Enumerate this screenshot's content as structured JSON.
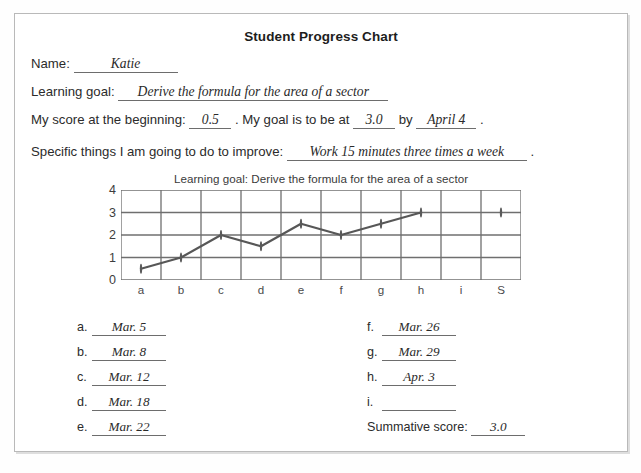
{
  "document": {
    "title": "Student Progress Chart"
  },
  "form": {
    "name_label": "Name:",
    "name_value": "Katie",
    "goal_label": "Learning goal:",
    "goal_value": "Derive the formula for the area of a sector",
    "score_label_1": "My score at the beginning:",
    "score_begin_value": "0.5",
    "score_label_2": ". My goal is to be at",
    "score_goal_value": "3.0",
    "score_label_3": "by",
    "score_date_value": "April 4",
    "score_label_4": ".",
    "specific_label": "Specific things I am going to do to improve:",
    "specific_value": "Work 15 minutes three times a week",
    "specific_suffix": "."
  },
  "chart_data": {
    "type": "line",
    "title": "Learning goal: Derive the formula for the area of a sector",
    "xlabel": "",
    "ylabel": "",
    "categories": [
      "a",
      "b",
      "c",
      "d",
      "e",
      "f",
      "g",
      "h",
      "i",
      "S"
    ],
    "values": [
      0.5,
      1.0,
      2.0,
      1.5,
      2.5,
      2.0,
      2.5,
      3.0,
      null,
      3.0
    ],
    "ylim": [
      0,
      4
    ],
    "yticks": [
      0,
      1,
      2,
      3,
      4
    ],
    "grid": true,
    "legend": "none",
    "line_color": "#575757",
    "marker_color": "#5a5a5a",
    "grid_color": "#6f6f6f",
    "series": [
      {
        "name": "Student score",
        "values": [
          0.5,
          1.0,
          2.0,
          1.5,
          2.5,
          2.0,
          2.5,
          3.0,
          null,
          3.0
        ]
      }
    ]
  },
  "dates": {
    "left": [
      {
        "label": "a.",
        "value": "Mar. 5"
      },
      {
        "label": "b.",
        "value": "Mar. 8"
      },
      {
        "label": "c.",
        "value": "Mar. 12"
      },
      {
        "label": "d.",
        "value": "Mar. 18"
      },
      {
        "label": "e.",
        "value": "Mar. 22"
      }
    ],
    "right": [
      {
        "label": "f.",
        "value": "Mar. 26"
      },
      {
        "label": "g.",
        "value": "Mar. 29"
      },
      {
        "label": "h.",
        "value": "Apr. 3"
      },
      {
        "label": "i.",
        "value": ""
      }
    ],
    "summative_label": "Summative score:",
    "summative_value": "3.0"
  }
}
